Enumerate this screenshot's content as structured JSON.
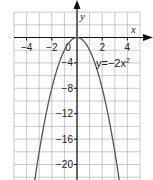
{
  "chart_data": {
    "type": "line",
    "title": "",
    "xlabel": "x",
    "ylabel": "y",
    "xlim": [
      -5,
      5
    ],
    "ylim": [
      -22,
      4
    ],
    "grid": true,
    "x_ticks": [
      -4,
      -2,
      0,
      2,
      4
    ],
    "x_tick_labels": [
      "−4",
      "−2",
      "0",
      "2",
      "4"
    ],
    "y_ticks": [
      -4,
      -8,
      -12,
      -16,
      -20
    ],
    "y_tick_labels": [
      "−4",
      "−8",
      "−12",
      "−16",
      "−20"
    ],
    "series": [
      {
        "name": "y=−2x²",
        "equation": "y = -2x^2",
        "x": [
          -3.3,
          -3,
          -2.5,
          -2,
          -1.5,
          -1,
          -0.5,
          0,
          0.5,
          1,
          1.5,
          2,
          2.5,
          3,
          3.3
        ],
        "y": [
          -21.78,
          -18,
          -12.5,
          -8,
          -4.5,
          -2,
          -0.5,
          0,
          -0.5,
          -2,
          -4.5,
          -8,
          -12.5,
          -18,
          -21.78
        ]
      }
    ],
    "annotations": [
      {
        "text": "y=−2x²",
        "x": 1.5,
        "y": -4
      }
    ],
    "colors": {
      "curve": "#555555",
      "grid": "#bbbbbb",
      "axis": "#111111"
    }
  },
  "labels": {
    "x_axis": "x",
    "y_axis": "y",
    "equation_prefix": "y=−2x",
    "equation_exp": "2"
  }
}
